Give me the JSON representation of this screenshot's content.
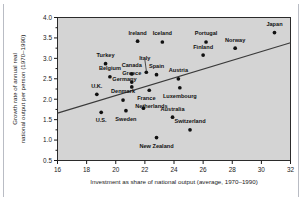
{
  "figure": {
    "name": "investment-vs-growth-scatter"
  },
  "chart_data": {
    "type": "scatter",
    "title": "",
    "subtitle": "",
    "xlabel": "Investment as share of national output (average, 1970–1990)",
    "ylabel": "Growth rate of annual real national output per person (1970–1990)",
    "xlim": [
      16,
      32
    ],
    "ylim": [
      0.5,
      4.0
    ],
    "xticks": [
      16,
      18,
      20,
      22,
      24,
      26,
      28,
      30,
      32
    ],
    "yticks": [
      0.5,
      1.0,
      1.5,
      2.0,
      2.5,
      3.0,
      3.5,
      4.0
    ],
    "xtick_labels": [
      "16",
      "18",
      "20",
      "22",
      "24",
      "26",
      "28",
      "30",
      "32"
    ],
    "ytick_labels": [
      "0.5",
      "1.0",
      "1.5",
      "2.0",
      "2.5",
      "3.0",
      "3.5",
      "4.0"
    ],
    "grid": false,
    "legend": "none",
    "plot_background_color": "#d4d4d4",
    "point_color": "#111111",
    "trend_line_color": "#3a3a3a",
    "trend_line": {
      "x_start": 16.0,
      "y_start": 1.66,
      "x_end": 32.0,
      "y_end": 3.38
    },
    "points": [
      {
        "name": "Japan",
        "x": 30.9,
        "y": 3.63,
        "label_dx": 0.0,
        "label_dy": 0.2,
        "leader": false
      },
      {
        "name": "Ireland",
        "x": 21.5,
        "y": 3.42,
        "label_dx": 0.0,
        "label_dy": 0.2,
        "leader": false
      },
      {
        "name": "Iceland",
        "x": 23.2,
        "y": 3.4,
        "label_dx": 0.0,
        "label_dy": 0.2,
        "leader": false
      },
      {
        "name": "Portugal",
        "x": 26.2,
        "y": 3.4,
        "label_dx": 0.0,
        "label_dy": 0.2,
        "leader": false
      },
      {
        "name": "Norway",
        "x": 28.2,
        "y": 3.25,
        "label_dx": 0.0,
        "label_dy": 0.2,
        "leader": false
      },
      {
        "name": "Finland",
        "x": 26.0,
        "y": 3.08,
        "label_dx": 0.0,
        "label_dy": 0.2,
        "leader": false
      },
      {
        "name": "Turkey",
        "x": 19.3,
        "y": 2.87,
        "label_dx": 0.0,
        "label_dy": 0.2,
        "leader": false
      },
      {
        "name": "Italy",
        "x": 22.1,
        "y": 2.66,
        "label_dx": -0.1,
        "label_dy": 0.33,
        "leader": true
      },
      {
        "name": "Canada",
        "x": 21.1,
        "y": 2.62,
        "label_dx": 0.0,
        "label_dy": 0.2,
        "leader": false
      },
      {
        "name": "Spain",
        "x": 22.8,
        "y": 2.6,
        "label_dx": 0.0,
        "label_dy": 0.2,
        "leader": false
      },
      {
        "name": "Belgium",
        "x": 19.6,
        "y": 2.55,
        "label_dx": 0.0,
        "label_dy": 0.2,
        "leader": false
      },
      {
        "name": "Austria",
        "x": 24.3,
        "y": 2.5,
        "label_dx": 0.0,
        "label_dy": 0.2,
        "leader": false
      },
      {
        "name": "Greece",
        "x": 21.1,
        "y": 2.42,
        "label_dx": 0.0,
        "label_dy": 0.2,
        "leader": false
      },
      {
        "name": "Germany",
        "x": 21.1,
        "y": 2.3,
        "label_dx": -0.5,
        "label_dy": 0.19,
        "leader": false
      },
      {
        "name": "Luxembourg",
        "x": 24.4,
        "y": 2.28,
        "label_dx": 0.0,
        "label_dy": -0.22,
        "leader": false
      },
      {
        "name": "France",
        "x": 22.3,
        "y": 2.22,
        "label_dx": -0.2,
        "label_dy": -0.21,
        "leader": false
      },
      {
        "name": "U.K.",
        "x": 18.7,
        "y": 2.12,
        "label_dx": 0.0,
        "label_dy": 0.2,
        "leader": false
      },
      {
        "name": "Denmark",
        "x": 20.5,
        "y": 1.98,
        "label_dx": 0.0,
        "label_dy": 0.2,
        "leader": false
      },
      {
        "name": "Netherlands",
        "x": 21.9,
        "y": 1.78,
        "label_dx": 0.55,
        "label_dy": 0.05,
        "leader": false
      },
      {
        "name": "Sweden",
        "x": 20.7,
        "y": 1.72,
        "label_dx": 0.0,
        "label_dy": -0.21,
        "leader": false
      },
      {
        "name": "U.S.",
        "x": 19.0,
        "y": 1.68,
        "label_dx": 0.0,
        "label_dy": -0.21,
        "leader": false
      },
      {
        "name": "Australia",
        "x": 23.9,
        "y": 1.56,
        "label_dx": 0.0,
        "label_dy": 0.2,
        "leader": false
      },
      {
        "name": "Switzerland",
        "x": 25.1,
        "y": 1.25,
        "label_dx": 0.0,
        "label_dy": 0.2,
        "leader": false
      },
      {
        "name": "New Zealand",
        "x": 22.8,
        "y": 1.06,
        "label_dx": 0.0,
        "label_dy": -0.22,
        "leader": false
      }
    ]
  }
}
